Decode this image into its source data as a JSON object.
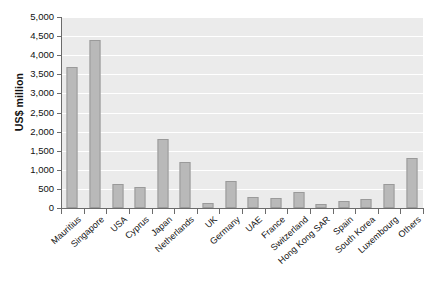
{
  "chart_data": {
    "type": "bar",
    "title": "",
    "subtitle": "",
    "xlabel": "",
    "ylabel": "US$ million",
    "ylim": [
      0,
      5000
    ],
    "ytick_step": 500,
    "grid": true,
    "legend": false,
    "orientation": "vertical",
    "categories": [
      "Mauritius",
      "Singapore",
      "USA",
      "Cyprus",
      "Japan",
      "Netherlands",
      "UK",
      "Germany",
      "UAE",
      "France",
      "Switzerland",
      "Hong Kong SAR",
      "Spain",
      "South Korea",
      "Luxembourg",
      "Others"
    ],
    "values": [
      3700,
      4400,
      620,
      540,
      1800,
      1200,
      130,
      700,
      290,
      270,
      420,
      110,
      190,
      230,
      620,
      1300
    ],
    "ytick_labels": [
      "0",
      "500",
      "1,000",
      "1,500",
      "2,000",
      "2,500",
      "3,000",
      "3,500",
      "4,000",
      "4,500",
      "5,000"
    ],
    "ytick_values": [
      0,
      500,
      1000,
      1500,
      2000,
      2500,
      3000,
      3500,
      4000,
      4500,
      5000
    ],
    "colors": {
      "bar_fill": "#b9b9b9",
      "bar_stroke": "#9a9a9a",
      "plot_background": "#ebebeb",
      "gridline": "#ffffff",
      "axis": "#6b6b6b",
      "text": "#111111"
    }
  },
  "caption": ""
}
